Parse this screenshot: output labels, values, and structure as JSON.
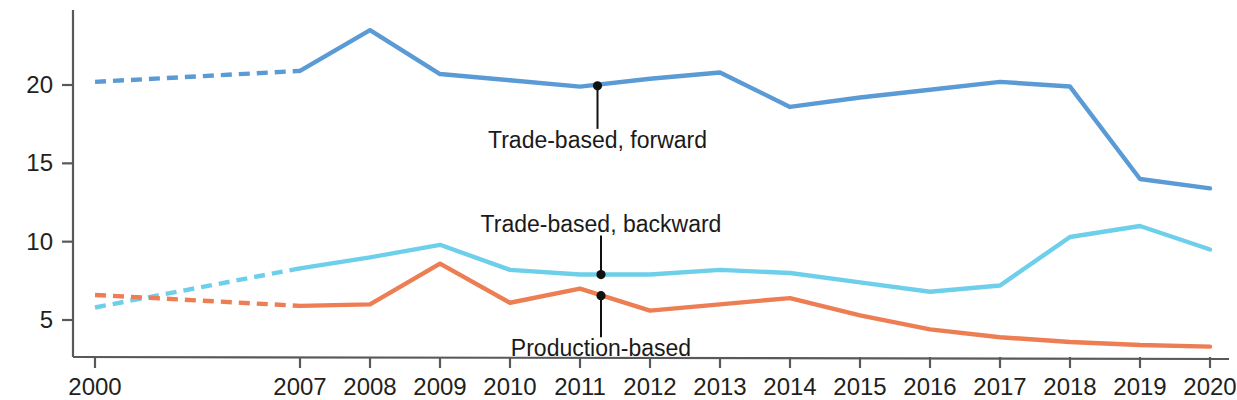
{
  "chart_data": {
    "type": "line",
    "title": "",
    "subtitle": "",
    "xlabel": "",
    "ylabel": "",
    "x": [
      2000,
      2007,
      2008,
      2009,
      2010,
      2011,
      2012,
      2013,
      2014,
      2015,
      2016,
      2017,
      2018,
      2019,
      2020
    ],
    "categories": [
      "2000",
      "2007",
      "2008",
      "2009",
      "2010",
      "2011",
      "2012",
      "2013",
      "2014",
      "2015",
      "2016",
      "2017",
      "2018",
      "2019",
      "2020"
    ],
    "xtick_labels": [
      "2000",
      "2007",
      "2008",
      "2009",
      "2010",
      "2011",
      "2012",
      "2013",
      "2014",
      "2015",
      "2016",
      "2017",
      "2018",
      "2019",
      "2020"
    ],
    "ytick_labels": [
      "5",
      "10",
      "15",
      "20"
    ],
    "yticks": [
      5,
      10,
      15,
      20
    ],
    "ylim": [
      2.6,
      24.6
    ],
    "xlim": [
      2000,
      2020
    ],
    "grid": false,
    "legend_position": "inline-annotations",
    "axis_color": "#58595b",
    "series": [
      {
        "name": "Trade-based, forward",
        "color": "#5B9BD5",
        "dashed_until": 2007,
        "values": [
          20.2,
          20.9,
          23.5,
          20.7,
          20.3,
          19.9,
          20.4,
          20.8,
          18.6,
          19.2,
          19.7,
          20.2,
          19.9,
          14.0,
          13.4
        ]
      },
      {
        "name": "Trade-based, backward",
        "color": "#6ECFEA",
        "dashed_until": 2007,
        "values": [
          5.8,
          8.3,
          9.0,
          9.8,
          8.2,
          7.9,
          7.9,
          8.2,
          8.0,
          7.4,
          6.8,
          7.2,
          10.3,
          11.0,
          9.5
        ]
      },
      {
        "name": "Production-based",
        "color": "#ED7D52",
        "dashed_until": 2007,
        "values": [
          6.6,
          5.9,
          6.0,
          8.6,
          6.1,
          7.0,
          5.6,
          6.0,
          6.4,
          5.3,
          4.4,
          3.9,
          3.6,
          3.4,
          3.3
        ]
      }
    ],
    "annotations": [
      {
        "text": "Trade-based, forward",
        "series": "Trade-based, forward",
        "anchor_x": 2011.25,
        "anchor_y": 19.95,
        "label_x": 2011.25,
        "label_y": 17.2,
        "leader": "below",
        "dot": true
      },
      {
        "text": "Trade-based, backward",
        "series": "Trade-based, backward",
        "anchor_x": 2011.3,
        "anchor_y": 7.9,
        "label_x": 2011.3,
        "label_y": 10.4,
        "leader": "above",
        "dot": true
      },
      {
        "text": "Production-based",
        "series": "Production-based",
        "anchor_x": 2011.3,
        "anchor_y": 6.55,
        "label_x": 2011.3,
        "label_y": 3.9,
        "leader": "below",
        "dot": true
      }
    ]
  },
  "axis": {
    "y_tick_labels": [
      "20",
      "15",
      "10",
      "5"
    ],
    "x_tick_labels": [
      "2000",
      "2007",
      "2008",
      "2009",
      "2010",
      "2011",
      "2012",
      "2013",
      "2014",
      "2015",
      "2016",
      "2017",
      "2018",
      "2019",
      "2020"
    ]
  }
}
